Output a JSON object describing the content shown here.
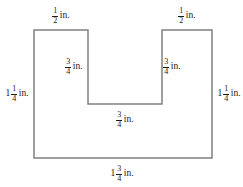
{
  "figure": {
    "name": "u-shaped-polygon",
    "stroke_color": "#808080",
    "fill_color": "#ffffff",
    "background_color": "#ffffff",
    "stroke_width": 1.5,
    "vertices": [
      [
        34,
        30
      ],
      [
        88,
        30
      ],
      [
        88,
        104
      ],
      [
        162,
        104
      ],
      [
        162,
        30
      ],
      [
        212,
        30
      ],
      [
        212,
        158
      ],
      [
        34,
        158
      ]
    ]
  },
  "labels": {
    "top_left": {
      "whole": "",
      "numerator": "1",
      "denominator": "2",
      "unit": "in."
    },
    "top_right": {
      "whole": "",
      "numerator": "1",
      "denominator": "2",
      "unit": "in."
    },
    "left_side": {
      "whole": "1",
      "numerator": "1",
      "denominator": "4",
      "unit": "in."
    },
    "right_side": {
      "whole": "1",
      "numerator": "1",
      "denominator": "4",
      "unit": "in."
    },
    "inner_left": {
      "whole": "",
      "numerator": "3",
      "denominator": "4",
      "unit": "in."
    },
    "inner_right": {
      "whole": "",
      "numerator": "3",
      "denominator": "4",
      "unit": "in."
    },
    "notch_bottom": {
      "whole": "",
      "numerator": "3",
      "denominator": "4",
      "unit": "in."
    },
    "bottom": {
      "whole": "1",
      "numerator": "3",
      "denominator": "4",
      "unit": "in."
    }
  }
}
